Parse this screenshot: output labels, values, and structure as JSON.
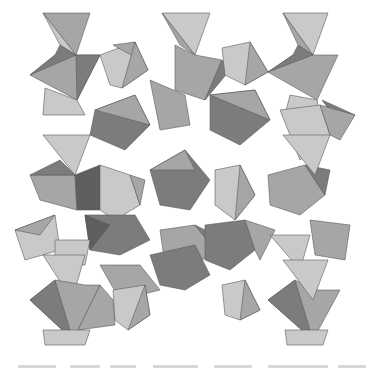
{
  "figure": {
    "colors": {
      "light": "#c9c9c9",
      "mid": "#a6a6a6",
      "dark": "#7c7c7c",
      "darkest": "#5e5e5e",
      "edge": "#5a5a5a",
      "background": "#ffffff"
    },
    "polygons": [
      {
        "pts": "43,13 90,13 76,55",
        "shade": "mid"
      },
      {
        "pts": "43,13 76,55 60,45",
        "shade": "light"
      },
      {
        "pts": "30,75 55,55 76,55 100,55 77,100",
        "shade": "mid"
      },
      {
        "pts": "30,75 55,55 60,45 76,55",
        "shade": "dark"
      },
      {
        "pts": "76,55 100,55 77,100",
        "shade": "dark"
      },
      {
        "pts": "45,88 77,100 85,115 43,115",
        "shade": "light"
      },
      {
        "pts": "100,55 135,42 148,70 122,88 110,85",
        "shade": "light"
      },
      {
        "pts": "113,45 135,42 140,60",
        "shade": "mid"
      },
      {
        "pts": "135,42 148,70 122,88",
        "shade": "mid"
      },
      {
        "pts": "162,13 210,13 195,55",
        "shade": "light"
      },
      {
        "pts": "162,13 195,55 180,45",
        "shade": "mid"
      },
      {
        "pts": "175,45 195,55 222,60 205,100 175,90",
        "shade": "mid"
      },
      {
        "pts": "205,100 222,60 230,70",
        "shade": "dark"
      },
      {
        "pts": "222,48 250,42 268,72 245,85 225,75",
        "shade": "light"
      },
      {
        "pts": "250,42 268,72 245,85",
        "shade": "mid"
      },
      {
        "pts": "283,13 328,13 313,55",
        "shade": "light"
      },
      {
        "pts": "283,13 313,55 298,45",
        "shade": "mid"
      },
      {
        "pts": "268,72 293,55 313,55 338,55 317,100",
        "shade": "mid"
      },
      {
        "pts": "268,72 293,55 298,45 313,55",
        "shade": "dark"
      },
      {
        "pts": "290,95 317,100 320,115 285,115",
        "shade": "light"
      },
      {
        "pts": "322,100 355,115 340,125",
        "shade": "dark"
      },
      {
        "pts": "95,110 135,95 150,125 125,150 90,135",
        "shade": "dark"
      },
      {
        "pts": "95,110 135,95 150,125",
        "shade": "mid"
      },
      {
        "pts": "150,80 185,95 190,125 160,130",
        "shade": "mid"
      },
      {
        "pts": "210,95 255,90 270,120 240,145 210,130",
        "shade": "dark"
      },
      {
        "pts": "210,95 255,90 270,120",
        "shade": "mid"
      },
      {
        "pts": "280,110 320,105 330,135 300,160",
        "shade": "light"
      },
      {
        "pts": "320,105 355,115 340,140 330,135",
        "shade": "mid"
      },
      {
        "pts": "43,135 90,135 75,175",
        "shade": "light"
      },
      {
        "pts": "30,175 75,175 77,210 40,200",
        "shade": "mid"
      },
      {
        "pts": "60,160 75,175 30,175",
        "shade": "dark"
      },
      {
        "pts": "75,175 100,165 100,210 77,210",
        "shade": "darkest"
      },
      {
        "pts": "100,165 130,175 140,205 115,220 100,210",
        "shade": "light"
      },
      {
        "pts": "130,175 145,180 140,205",
        "shade": "mid"
      },
      {
        "pts": "150,170 185,150 210,180 190,210 160,205",
        "shade": "dark"
      },
      {
        "pts": "150,170 185,150 195,170",
        "shade": "mid"
      },
      {
        "pts": "215,170 240,165 255,195 235,220 215,205",
        "shade": "light"
      },
      {
        "pts": "240,165 255,195 235,220",
        "shade": "mid"
      },
      {
        "pts": "268,175 305,165 325,195 300,215 270,205",
        "shade": "mid"
      },
      {
        "pts": "305,165 325,195 330,170",
        "shade": "dark"
      },
      {
        "pts": "283,135 330,135 315,175",
        "shade": "light"
      },
      {
        "pts": "15,230 55,215 60,250 25,260",
        "shade": "light"
      },
      {
        "pts": "15,230 55,215 40,235",
        "shade": "mid"
      },
      {
        "pts": "85,215 135,215 150,240 120,255 90,250",
        "shade": "dark"
      },
      {
        "pts": "85,215 110,225 90,250",
        "shade": "darkest"
      },
      {
        "pts": "55,240 90,240 85,265 55,265",
        "shade": "light"
      },
      {
        "pts": "100,265 140,265 160,290 120,300",
        "shade": "mid"
      },
      {
        "pts": "160,230 195,225 215,250 190,270 165,265",
        "shade": "mid"
      },
      {
        "pts": "195,225 215,250 205,230",
        "shade": "dark"
      },
      {
        "pts": "205,225 245,220 255,250 230,270 205,260",
        "shade": "dark"
      },
      {
        "pts": "245,220 275,230 260,260 255,250",
        "shade": "mid"
      },
      {
        "pts": "270,235 310,235 300,270",
        "shade": "light"
      },
      {
        "pts": "310,220 350,225 345,260 315,255",
        "shade": "mid"
      },
      {
        "pts": "43,255 85,255 72,300",
        "shade": "light"
      },
      {
        "pts": "30,300 55,280 85,285 100,285 73,340",
        "shade": "mid"
      },
      {
        "pts": "30,300 55,280 73,340",
        "shade": "dark"
      },
      {
        "pts": "100,285 113,300 115,325 78,330",
        "shade": "mid"
      },
      {
        "pts": "113,290 145,285 150,315 128,330 115,320",
        "shade": "light"
      },
      {
        "pts": "145,285 150,315 128,330",
        "shade": "mid"
      },
      {
        "pts": "43,330 90,330 85,345 45,345",
        "shade": "light"
      },
      {
        "pts": "150,255 195,245 210,275 185,290 160,285",
        "shade": "dark"
      },
      {
        "pts": "222,285 245,280 260,310 240,320 225,315",
        "shade": "light"
      },
      {
        "pts": "245,280 260,310 240,320",
        "shade": "mid"
      },
      {
        "pts": "268,300 295,280 315,290 340,290 313,340",
        "shade": "mid"
      },
      {
        "pts": "268,300 295,280 313,340",
        "shade": "dark"
      },
      {
        "pts": "283,260 328,260 313,300",
        "shade": "light"
      },
      {
        "pts": "285,330 328,330 323,345 287,345",
        "shade": "light"
      }
    ]
  },
  "caption": {
    "legible": false,
    "bars": [
      {
        "left": 0,
        "width": 38
      },
      {
        "left": 52,
        "width": 30
      },
      {
        "left": 92,
        "width": 26
      },
      {
        "left": 135,
        "width": 45
      },
      {
        "left": 196,
        "width": 38
      },
      {
        "left": 250,
        "width": 60
      },
      {
        "left": 320,
        "width": 28
      }
    ]
  }
}
